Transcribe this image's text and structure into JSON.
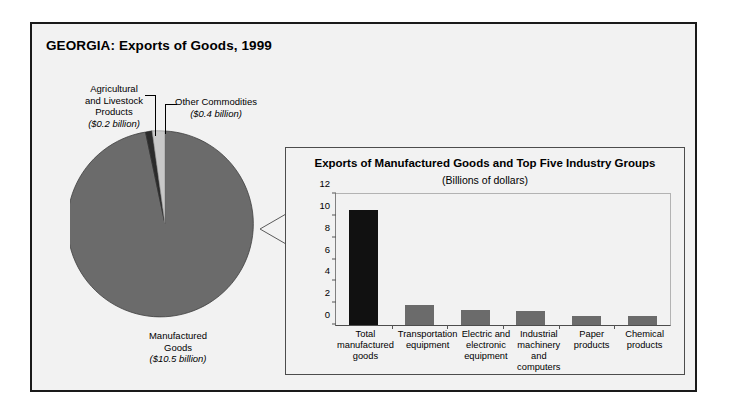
{
  "figure": {
    "title": "GEORGIA: Exports of Goods, 1999",
    "colors": {
      "panel_background": "#f2f2f2",
      "border": "#1a1a1a",
      "pie_major": "#6b6b6b",
      "pie_dark": "#2b2b2b",
      "pie_light": "#c8c8c8",
      "bar_gray": "#6b6b6b",
      "bar_highlight": "#111111"
    }
  },
  "pie": {
    "labels": {
      "agricultural": {
        "name": "Agricultural and Livestock Products",
        "line1": "Agricultural",
        "line2": "and Livestock",
        "line3": "Products",
        "amount": "($0.2 billion)"
      },
      "other": {
        "name": "Other Commodities",
        "line1": "Other Commodities",
        "amount": "($0.4 billion)"
      },
      "manufactured": {
        "name": "Manufactured Goods",
        "line1": "Manufactured",
        "line2": "Goods",
        "amount": "($10.5 billion)"
      }
    }
  },
  "inset": {
    "title": "Exports of Manufactured Goods and Top Five Industry Groups",
    "subtitle": "(Billions of dollars)"
  },
  "chart_data": [
    {
      "type": "pie",
      "title": "GEORGIA: Exports of Goods, 1999",
      "unit": "billions of dollars",
      "labels": [
        "Manufactured Goods",
        "Agricultural and Livestock Products",
        "Other Commodities"
      ],
      "values": [
        10.5,
        0.2,
        0.4
      ],
      "value_labels": [
        "($10.5 billion)",
        "($0.2 billion)",
        "($0.4 billion)"
      ],
      "colors": [
        "#6b6b6b",
        "#2b2b2b",
        "#c8c8c8"
      ],
      "total": 11.1,
      "legend": "none",
      "annotations": [
        "Callout leader lines connect small slices to their labels"
      ]
    },
    {
      "type": "bar",
      "title": "Exports of Manufactured Goods and Top Five Industry Groups",
      "subtitle": "(Billions of dollars)",
      "categories": [
        "Total manufactured goods",
        "Transportation equipment",
        "Electric and electronic equipment",
        "Industrial machinery and computers",
        "Paper products",
        "Chemical products"
      ],
      "category_lines": [
        [
          "Total",
          "manufactured",
          "goods"
        ],
        [
          "Transportation",
          "equipment"
        ],
        [
          "Electric and",
          "electronic",
          "equipment"
        ],
        [
          "Industrial",
          "machinery and",
          "computers"
        ],
        [
          "Paper",
          "products"
        ],
        [
          "Chemical",
          "products"
        ]
      ],
      "values": [
        10.5,
        1.85,
        1.4,
        1.3,
        0.85,
        0.85
      ],
      "bar_colors": [
        "#111111",
        "#6b6b6b",
        "#6b6b6b",
        "#6b6b6b",
        "#6b6b6b",
        "#6b6b6b"
      ],
      "xlabel": "",
      "ylabel": "",
      "ylim": [
        0,
        12
      ],
      "yticks": [
        0,
        2,
        4,
        6,
        8,
        10,
        12
      ],
      "grid": false,
      "legend": "none"
    }
  ]
}
